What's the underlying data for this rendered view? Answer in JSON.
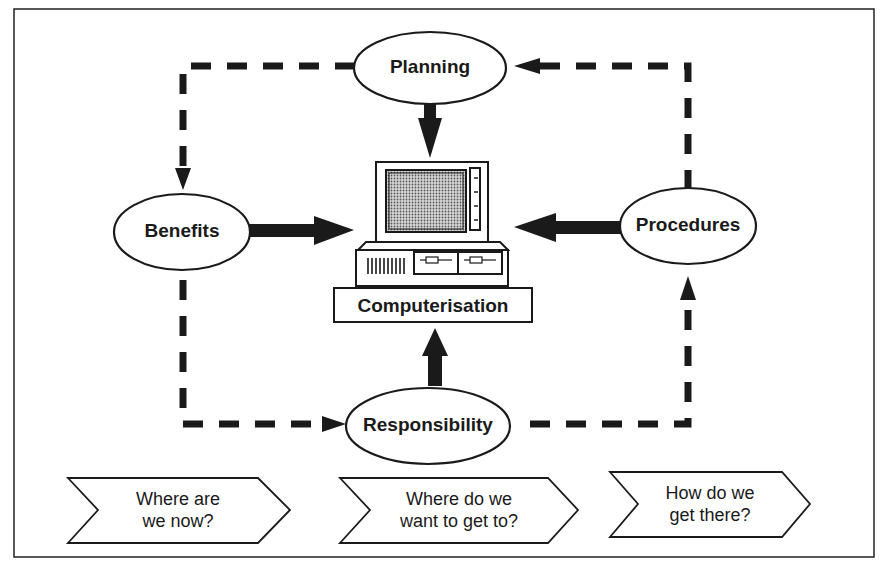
{
  "diagram": {
    "center": {
      "label": "Computerisation"
    },
    "nodes": {
      "planning": {
        "label": "Planning"
      },
      "benefits": {
        "label": "Benefits"
      },
      "procedures": {
        "label": "Procedures"
      },
      "responsibility": {
        "label": "Responsibility"
      }
    },
    "steps": [
      {
        "line1": "Where are",
        "line2": "we now?"
      },
      {
        "line1": "Where do we",
        "line2": "want to get to?"
      },
      {
        "line1": "How do we",
        "line2": "get there?"
      }
    ],
    "colors": {
      "ink": "#1a1a1a",
      "background": "#ffffff",
      "screen": "#9a9a9a"
    }
  }
}
